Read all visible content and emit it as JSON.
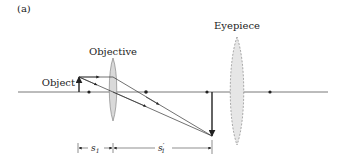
{
  "figure": {
    "panel_label": "(a)",
    "labels": {
      "objective": "Objective",
      "eyepiece": "Eyepiece",
      "object": "Object"
    },
    "dimensions": {
      "s1": "s",
      "s1_sub": "1",
      "s1_prime": "s",
      "s1_prime_sub": "1",
      "s1_prime_mark": "′"
    },
    "colors": {
      "line": "#222222",
      "axis": "#555555",
      "lens_fill": "#d9d9d9",
      "lens_stroke": "#777777"
    }
  }
}
